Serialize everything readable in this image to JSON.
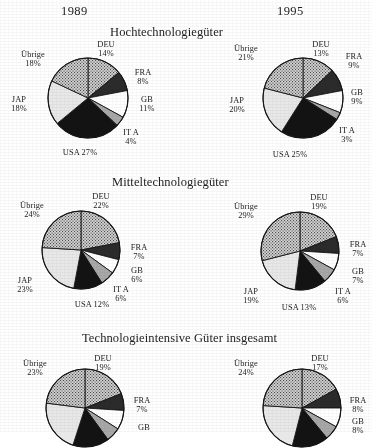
{
  "header": {
    "year_left": "1989",
    "year_right": "1995"
  },
  "sections": [
    {
      "title": "Hochtechnologiegüter"
    },
    {
      "title": "Mitteltechnologiegüter"
    },
    {
      "title": "Technologieintensive Güter insgesamt"
    }
  ],
  "palette": {
    "DEU": "#9a9a9a",
    "FRA": "#2b2b2b",
    "GB": "#ffffff",
    "ITA": "#a8a8a8",
    "USA": "#131313",
    "JAP": "#e8e8e8",
    "Übrige": "#8f8f8f",
    "outline": "#161616",
    "text": "#1d1d1d",
    "background": "#ffffff"
  },
  "chart_data": [
    {
      "type": "pie",
      "title": "Hochtechnologiegüter",
      "year": "1989",
      "labels": [
        "DEU",
        "FRA",
        "GB",
        "ITA",
        "USA",
        "JAP",
        "Übrige"
      ],
      "values": [
        14,
        8,
        11,
        4,
        27,
        18,
        18
      ],
      "value_labels": [
        "14%",
        "8%",
        "11%",
        "4%",
        "27%",
        "18%",
        "18%"
      ],
      "start_angle_deg": 0,
      "direction": "clockwise"
    },
    {
      "type": "pie",
      "title": "Hochtechnologiegüter",
      "year": "1995",
      "labels": [
        "DEU",
        "FRA",
        "GB",
        "ITA",
        "USA",
        "JAP",
        "Übrige"
      ],
      "values": [
        13,
        9,
        9,
        3,
        25,
        20,
        21
      ],
      "value_labels": [
        "13%",
        "9%",
        "9%",
        "3%",
        "25%",
        "20%",
        "21%"
      ],
      "start_angle_deg": 0,
      "direction": "clockwise"
    },
    {
      "type": "pie",
      "title": "Mitteltechnologiegüter",
      "year": "1989",
      "labels": [
        "DEU",
        "FRA",
        "GB",
        "ITA",
        "USA",
        "JAP",
        "Übrige"
      ],
      "values": [
        22,
        7,
        6,
        6,
        12,
        23,
        24
      ],
      "value_labels": [
        "22%",
        "7%",
        "6%",
        "6%",
        "12%",
        "23%",
        "24%"
      ],
      "start_angle_deg": 0,
      "direction": "clockwise"
    },
    {
      "type": "pie",
      "title": "Mitteltechnologiegüter",
      "year": "1995",
      "labels": [
        "DEU",
        "FRA",
        "GB",
        "ITA",
        "USA",
        "JAP",
        "Übrige"
      ],
      "values": [
        19,
        7,
        7,
        6,
        13,
        19,
        29
      ],
      "value_labels": [
        "19%",
        "7%",
        "7%",
        "6%",
        "13%",
        "19%",
        "29%"
      ],
      "start_angle_deg": 0,
      "direction": "clockwise"
    },
    {
      "type": "pie",
      "title": "Technologieintensive Güter insgesamt",
      "year": "1989",
      "labels": [
        "DEU",
        "FRA",
        "GB",
        "ITA",
        "USA",
        "JAP",
        "Übrige"
      ],
      "values": [
        19,
        7,
        8,
        6,
        15,
        22,
        23
      ],
      "value_labels": [
        "19%",
        "7%",
        "8%",
        "",
        "",
        "",
        "23%"
      ],
      "start_angle_deg": 0,
      "direction": "clockwise"
    },
    {
      "type": "pie",
      "title": "Technologieintensive Güter insgesamt",
      "year": "1995",
      "labels": [
        "DEU",
        "FRA",
        "GB",
        "ITA",
        "USA",
        "JAP",
        "Übrige"
      ],
      "values": [
        17,
        8,
        8,
        6,
        15,
        22,
        24
      ],
      "value_labels": [
        "17%",
        "8%",
        "8%",
        "",
        "",
        "",
        "24%"
      ],
      "start_angle_deg": 0,
      "direction": "clockwise"
    }
  ],
  "annotations": {
    "c1": {
      "deu_name": "DEU",
      "deu_val": "14%",
      "fra_name": "FRA",
      "fra_val": "8%",
      "gb_name": "GB",
      "gb_val": "11%",
      "ita_name": "IT A",
      "ita_val": "4%",
      "usa": "USA 27%",
      "jap_name": "JAP",
      "jap_val": "18%",
      "ubr_name": "Übrige",
      "ubr_val": "18%"
    },
    "c2": {
      "deu_name": "DEU",
      "deu_val": "13%",
      "fra_name": "FRA",
      "fra_val": "9%",
      "gb_name": "GB",
      "gb_val": "9%",
      "ita_name": "IT A",
      "ita_val": "3%",
      "usa": "USA 25%",
      "jap_name": "JAP",
      "jap_val": "20%",
      "ubr_name": "Übrige",
      "ubr_val": "21%"
    },
    "c3": {
      "deu_name": "DEU",
      "deu_val": "22%",
      "fra_name": "FRA",
      "fra_val": "7%",
      "gb_name": "GB",
      "gb_val": "6%",
      "ita_name": "IT A",
      "ita_val": "6%",
      "usa": "USA 12%",
      "jap_name": "JAP",
      "jap_val": "23%",
      "ubr_name": "Übrige",
      "ubr_val": "24%"
    },
    "c4": {
      "deu_name": "DEU",
      "deu_val": "19%",
      "fra_name": "FRA",
      "fra_val": "7%",
      "gb_name": "GB",
      "gb_val": "7%",
      "ita_name": "IT A",
      "ita_val": "6%",
      "usa": "USA 13%",
      "jap_name": "JAP",
      "jap_val": "19%",
      "ubr_name": "Übrige",
      "ubr_val": "29%"
    },
    "c5": {
      "deu_name": "DEU",
      "deu_val": "19%",
      "fra_name": "FRA",
      "fra_val": "7%",
      "gb_name": "GB",
      "ubr_name": "Übrige",
      "ubr_val": "23%"
    },
    "c6": {
      "deu_name": "DEU",
      "deu_val": "17%",
      "fra_name": "FRA",
      "fra_val": "8%",
      "gb_name": "GB",
      "gb_val": "8%",
      "ubr_name": "Übrige",
      "ubr_val": "24%"
    }
  }
}
